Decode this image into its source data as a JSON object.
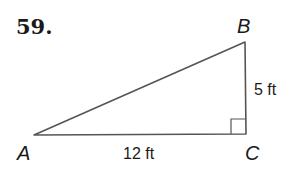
{
  "problem": {
    "number": "59."
  },
  "triangle": {
    "vertices": [
      {
        "name": "A",
        "label": "A"
      },
      {
        "name": "B",
        "label": "B"
      },
      {
        "name": "C",
        "label": "C"
      }
    ],
    "sides": {
      "BC": "5 ft",
      "AC": "12 ft"
    },
    "right_angle_at": "C",
    "stroke_color": "#555555"
  }
}
